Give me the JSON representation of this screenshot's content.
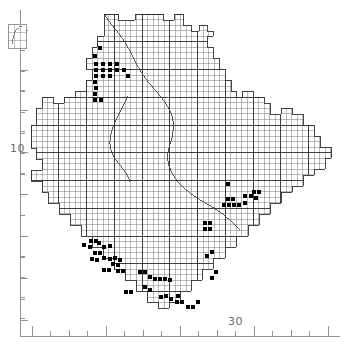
{
  "figure": {
    "kind": "species-distribution-dot-map",
    "background_color": "#ffffff",
    "ink_color": "#1a1a1a",
    "grid_color": "#545454",
    "coast_color": "#3a3a3a",
    "axis_color": "#808080",
    "dot_color": "#000000",
    "width": 347,
    "height": 346
  },
  "axes": {
    "left": {
      "name": "latitude-axis",
      "labels": [
        {
          "text": "10",
          "x": 10,
          "y": 152
        }
      ],
      "major_ticks_y": [
        30,
        70,
        110,
        152,
        194,
        236,
        278,
        320
      ],
      "minor_ticks_y": [
        50,
        90,
        131,
        173,
        215,
        257,
        299
      ]
    },
    "bottom": {
      "name": "longitude-axis",
      "labels": [
        {
          "text": "30",
          "x": 228,
          "y": 325
        }
      ],
      "major_ticks_x": [
        32,
        106,
        180,
        254,
        328
      ],
      "minor_ticks_x": [
        69,
        143,
        217,
        291
      ]
    }
  },
  "inset": {
    "name": "locator-inset",
    "x": 8,
    "y": 24,
    "width": 18,
    "height": 24,
    "caption": ""
  },
  "chart_data": {
    "type": "scatter",
    "title": "",
    "subtitle": "",
    "xlabel": "",
    "ylabel": "",
    "grid": true,
    "legend": "none",
    "x_tick_labels": [
      "30"
    ],
    "y_tick_labels": [
      "10"
    ],
    "grid_cell_px": 5.55,
    "grid_major_every": 5,
    "outline": [
      [
        104,
        14
      ],
      [
        118,
        14
      ],
      [
        118,
        20
      ],
      [
        135,
        20
      ],
      [
        135,
        14
      ],
      [
        163,
        14
      ],
      [
        163,
        20
      ],
      [
        174,
        20
      ],
      [
        174,
        14
      ],
      [
        183,
        14
      ],
      [
        183,
        25
      ],
      [
        191,
        25
      ],
      [
        191,
        31
      ],
      [
        199,
        31
      ],
      [
        199,
        25
      ],
      [
        207,
        25
      ],
      [
        207,
        31
      ],
      [
        213,
        31
      ],
      [
        213,
        36
      ],
      [
        207,
        36
      ],
      [
        207,
        47
      ],
      [
        213,
        47
      ],
      [
        213,
        58
      ],
      [
        219,
        58
      ],
      [
        219,
        69
      ],
      [
        225,
        69
      ],
      [
        225,
        80
      ],
      [
        231,
        80
      ],
      [
        231,
        91
      ],
      [
        236,
        91
      ],
      [
        236,
        97
      ],
      [
        242,
        97
      ],
      [
        242,
        91
      ],
      [
        253,
        91
      ],
      [
        253,
        97
      ],
      [
        264,
        97
      ],
      [
        264,
        103
      ],
      [
        270,
        103
      ],
      [
        270,
        114
      ],
      [
        281,
        114
      ],
      [
        281,
        108
      ],
      [
        292,
        108
      ],
      [
        292,
        114
      ],
      [
        303,
        114
      ],
      [
        303,
        125
      ],
      [
        314,
        125
      ],
      [
        314,
        136
      ],
      [
        320,
        136
      ],
      [
        320,
        147
      ],
      [
        331,
        147
      ],
      [
        331,
        158
      ],
      [
        325,
        158
      ],
      [
        325,
        169
      ],
      [
        314,
        169
      ],
      [
        314,
        175
      ],
      [
        303,
        175
      ],
      [
        303,
        186
      ],
      [
        292,
        186
      ],
      [
        292,
        192
      ],
      [
        281,
        192
      ],
      [
        281,
        203
      ],
      [
        270,
        203
      ],
      [
        270,
        214
      ],
      [
        259,
        214
      ],
      [
        259,
        225
      ],
      [
        248,
        225
      ],
      [
        248,
        236
      ],
      [
        236,
        236
      ],
      [
        236,
        247
      ],
      [
        225,
        247
      ],
      [
        225,
        258
      ],
      [
        213,
        258
      ],
      [
        213,
        269
      ],
      [
        202,
        269
      ],
      [
        202,
        280
      ],
      [
        191,
        280
      ],
      [
        191,
        291
      ],
      [
        180,
        291
      ],
      [
        180,
        302
      ],
      [
        169,
        302
      ],
      [
        169,
        308
      ],
      [
        158,
        308
      ],
      [
        158,
        302
      ],
      [
        147,
        302
      ],
      [
        147,
        291
      ],
      [
        136,
        291
      ],
      [
        136,
        280
      ],
      [
        125,
        280
      ],
      [
        125,
        269
      ],
      [
        114,
        269
      ],
      [
        114,
        258
      ],
      [
        103,
        258
      ],
      [
        103,
        247
      ],
      [
        92,
        247
      ],
      [
        92,
        236
      ],
      [
        81,
        236
      ],
      [
        81,
        225
      ],
      [
        70,
        225
      ],
      [
        70,
        214
      ],
      [
        59,
        214
      ],
      [
        59,
        203
      ],
      [
        48,
        203
      ],
      [
        48,
        192
      ],
      [
        42,
        192
      ],
      [
        42,
        181
      ],
      [
        31,
        181
      ],
      [
        31,
        170
      ],
      [
        42,
        170
      ],
      [
        42,
        159
      ],
      [
        36,
        159
      ],
      [
        36,
        148
      ],
      [
        31,
        148
      ],
      [
        31,
        125
      ],
      [
        36,
        125
      ],
      [
        36,
        108
      ],
      [
        42,
        108
      ],
      [
        42,
        97
      ],
      [
        53,
        97
      ],
      [
        53,
        103
      ],
      [
        64,
        103
      ],
      [
        64,
        97
      ],
      [
        75,
        97
      ],
      [
        75,
        91
      ],
      [
        86,
        91
      ],
      [
        86,
        80
      ],
      [
        92,
        80
      ],
      [
        92,
        69
      ],
      [
        86,
        69
      ],
      [
        86,
        58
      ],
      [
        92,
        58
      ],
      [
        92,
        47
      ],
      [
        97,
        47
      ],
      [
        97,
        36
      ],
      [
        104,
        36
      ],
      [
        104,
        14
      ]
    ],
    "records": [
      {
        "x": 100,
        "y": 48
      },
      {
        "x": 95,
        "y": 56
      },
      {
        "x": 96,
        "y": 64
      },
      {
        "x": 103,
        "y": 64
      },
      {
        "x": 110,
        "y": 64
      },
      {
        "x": 117,
        "y": 64
      },
      {
        "x": 96,
        "y": 70
      },
      {
        "x": 103,
        "y": 70
      },
      {
        "x": 110,
        "y": 70
      },
      {
        "x": 117,
        "y": 70
      },
      {
        "x": 124,
        "y": 70
      },
      {
        "x": 96,
        "y": 76
      },
      {
        "x": 103,
        "y": 76
      },
      {
        "x": 110,
        "y": 76
      },
      {
        "x": 128,
        "y": 76
      },
      {
        "x": 95,
        "y": 82
      },
      {
        "x": 96,
        "y": 88
      },
      {
        "x": 95,
        "y": 94
      },
      {
        "x": 95,
        "y": 100
      },
      {
        "x": 101,
        "y": 100
      },
      {
        "x": 228,
        "y": 184
      },
      {
        "x": 245,
        "y": 196
      },
      {
        "x": 251,
        "y": 196
      },
      {
        "x": 228,
        "y": 199
      },
      {
        "x": 233,
        "y": 199
      },
      {
        "x": 229,
        "y": 205
      },
      {
        "x": 234,
        "y": 205
      },
      {
        "x": 224,
        "y": 205
      },
      {
        "x": 239,
        "y": 205
      },
      {
        "x": 245,
        "y": 203
      },
      {
        "x": 205,
        "y": 223
      },
      {
        "x": 210,
        "y": 223
      },
      {
        "x": 205,
        "y": 229
      },
      {
        "x": 210,
        "y": 229
      },
      {
        "x": 91,
        "y": 241
      },
      {
        "x": 96,
        "y": 241
      },
      {
        "x": 84,
        "y": 245
      },
      {
        "x": 90,
        "y": 247
      },
      {
        "x": 99,
        "y": 243
      },
      {
        "x": 104,
        "y": 247
      },
      {
        "x": 110,
        "y": 246
      },
      {
        "x": 95,
        "y": 253
      },
      {
        "x": 100,
        "y": 253
      },
      {
        "x": 92,
        "y": 259
      },
      {
        "x": 97,
        "y": 260
      },
      {
        "x": 104,
        "y": 258
      },
      {
        "x": 110,
        "y": 259
      },
      {
        "x": 115,
        "y": 258
      },
      {
        "x": 120,
        "y": 260
      },
      {
        "x": 113,
        "y": 264
      },
      {
        "x": 118,
        "y": 265
      },
      {
        "x": 104,
        "y": 270
      },
      {
        "x": 109,
        "y": 270
      },
      {
        "x": 118,
        "y": 271
      },
      {
        "x": 123,
        "y": 271
      },
      {
        "x": 140,
        "y": 272
      },
      {
        "x": 145,
        "y": 272
      },
      {
        "x": 150,
        "y": 277
      },
      {
        "x": 155,
        "y": 279
      },
      {
        "x": 160,
        "y": 279
      },
      {
        "x": 165,
        "y": 279
      },
      {
        "x": 170,
        "y": 280
      },
      {
        "x": 145,
        "y": 287
      },
      {
        "x": 150,
        "y": 290
      },
      {
        "x": 126,
        "y": 292
      },
      {
        "x": 131,
        "y": 292
      },
      {
        "x": 161,
        "y": 297
      },
      {
        "x": 166,
        "y": 296
      },
      {
        "x": 171,
        "y": 299
      },
      {
        "x": 177,
        "y": 302
      },
      {
        "x": 182,
        "y": 302
      },
      {
        "x": 178,
        "y": 296
      },
      {
        "x": 188,
        "y": 307
      },
      {
        "x": 193,
        "y": 307
      },
      {
        "x": 198,
        "y": 302
      },
      {
        "x": 212,
        "y": 278
      },
      {
        "x": 216,
        "y": 272
      },
      {
        "x": 207,
        "y": 256
      },
      {
        "x": 212,
        "y": 252
      },
      {
        "x": 254,
        "y": 192
      },
      {
        "x": 259,
        "y": 192
      },
      {
        "x": 256,
        "y": 198
      }
    ]
  }
}
